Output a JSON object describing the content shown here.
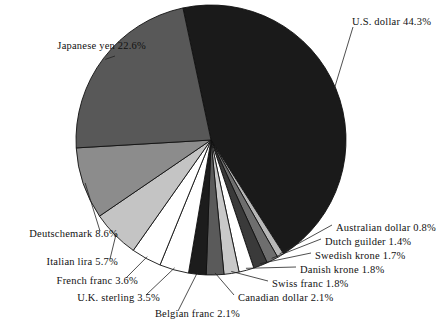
{
  "chart_data": {
    "type": "pie",
    "title": "",
    "subtitle": "",
    "xlabel": "",
    "ylabel": "",
    "units": "percent",
    "legend_position": "none",
    "labels_style": "outside-with-leader-lines",
    "grid": false,
    "start_angle_deg": -12,
    "direction": "clockwise",
    "categories": [
      "U.S. dollar",
      "Australian dollar",
      "Dutch guilder",
      "Swedish krone",
      "Danish krone",
      "Swiss franc",
      "Canadian dollar",
      "Belgian franc",
      "U.K. sterling",
      "French franc",
      "Italian lira",
      "Deutschemark",
      "Japanese yen"
    ],
    "values": [
      44.3,
      0.8,
      1.4,
      1.7,
      1.8,
      1.8,
      2.1,
      2.1,
      3.5,
      3.6,
      5.7,
      8.6,
      22.6
    ],
    "slice_colors": [
      "#1a1a1a",
      "#b8b8b8",
      "#6e6e6e",
      "#3a3a3a",
      "#ffffff",
      "#c9c9c9",
      "#5a5a5a",
      "#1c1c1c",
      "#ffffff",
      "#ffffff",
      "#c4c4c4",
      "#8c8c8c",
      "#585858"
    ],
    "slices": [
      {
        "label": "U.S. dollar 44.3%",
        "name": "U.S. dollar",
        "value": 44.3,
        "color": "#1a1a1a"
      },
      {
        "label": "Australian dollar 0.8%",
        "name": "Australian dollar",
        "value": 0.8,
        "color": "#b8b8b8"
      },
      {
        "label": "Dutch guilder 1.4%",
        "name": "Dutch guilder",
        "value": 1.4,
        "color": "#6e6e6e"
      },
      {
        "label": "Swedish krone 1.7%",
        "name": "Swedish krone",
        "value": 1.7,
        "color": "#3a3a3a"
      },
      {
        "label": "Danish krone 1.8%",
        "name": "Danish krone",
        "value": 1.8,
        "color": "#ffffff"
      },
      {
        "label": "Swiss franc 1.8%",
        "name": "Swiss franc",
        "value": 1.8,
        "color": "#c9c9c9"
      },
      {
        "label": "Canadian dollar 2.1%",
        "name": "Canadian dollar",
        "value": 2.1,
        "color": "#5a5a5a"
      },
      {
        "label": "Belgian franc 2.1%",
        "name": "Belgian franc",
        "value": 2.1,
        "color": "#1c1c1c"
      },
      {
        "label": "U.K. sterling 3.5%",
        "name": "U.K. sterling",
        "value": 3.5,
        "color": "#ffffff"
      },
      {
        "label": "French franc 3.6%",
        "name": "French franc",
        "value": 3.6,
        "color": "#ffffff"
      },
      {
        "label": "Italian lira 5.7%",
        "name": "Italian lira",
        "value": 5.7,
        "color": "#c4c4c4"
      },
      {
        "label": "Deutschemark 8.6%",
        "name": "Deutschemark",
        "value": 8.6,
        "color": "#8c8c8c"
      },
      {
        "label": "Japanese yen 22.6%",
        "name": "Japanese yen",
        "value": 22.6,
        "color": "#585858"
      }
    ]
  },
  "labels": {
    "us_dollar": "U.S. dollar 44.3%",
    "japanese_yen": "Japanese yen 22.6%",
    "deutschemark": "Deutschemark 8.6%",
    "italian_lira": "Italian lira 5.7%",
    "french_franc": "French franc 3.6%",
    "uk_sterling": "U.K. sterling 3.5%",
    "belgian_franc": "Belgian franc 2.1%",
    "canadian_dollar": "Canadian dollar 2.1%",
    "swiss_franc": "Swiss franc 1.8%",
    "danish_krone": "Danish krone 1.8%",
    "swedish_krone": "Swedish krone 1.7%",
    "dutch_guilder": "Dutch guilder 1.4%",
    "australian_dollar": "Australian dollar 0.8%"
  }
}
